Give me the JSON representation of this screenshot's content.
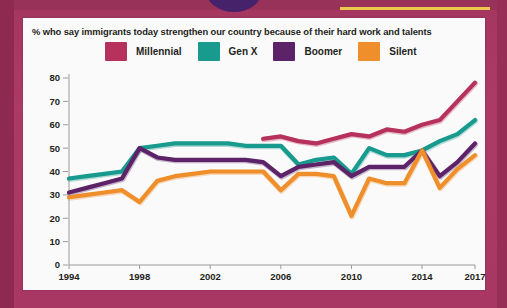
{
  "chart_title": "% who say immigrants today strengthen our country because of their hard work and talents",
  "legend": {
    "items": [
      {
        "label": "Millennial",
        "color": "#b6325c",
        "swatch_name": "legend-swatch-millennial"
      },
      {
        "label": "Gen X",
        "color": "#189a8e",
        "swatch_name": "legend-swatch-genx"
      },
      {
        "label": "Boomer",
        "color": "#5d2368",
        "swatch_name": "legend-swatch-boomer"
      },
      {
        "label": "Silent",
        "color": "#ef8f2c",
        "swatch_name": "legend-swatch-silent"
      }
    ]
  },
  "axes": {
    "y_ticks": [
      "0",
      "10",
      "20",
      "30",
      "40",
      "50",
      "60",
      "70",
      "80"
    ],
    "x_ticks": [
      "1994",
      "1998",
      "2002",
      "2006",
      "2010",
      "2014",
      "2017"
    ]
  },
  "decor": {
    "frame_color": "#a93b66",
    "circle_color": "#46226b",
    "accent_yellow": "#e9c84a"
  },
  "chart_data": {
    "type": "line",
    "title": "% who say immigrants today strengthen our country because of their hard work and talents",
    "xlabel": "",
    "ylabel": "",
    "xlim": [
      1994,
      2017
    ],
    "ylim": [
      0,
      80
    ],
    "grid": false,
    "legend_position": "top",
    "x_tick_values": [
      1994,
      1998,
      2002,
      2006,
      2010,
      2014,
      2017
    ],
    "y_tick_values": [
      0,
      10,
      20,
      30,
      40,
      50,
      60,
      70,
      80
    ],
    "series": [
      {
        "name": "Millennial",
        "color": "#b6325c",
        "x": [
          2005,
          2006,
          2007,
          2008,
          2009,
          2010,
          2011,
          2012,
          2013,
          2014,
          2015,
          2016,
          2017
        ],
        "values": [
          54,
          55,
          53,
          52,
          54,
          56,
          55,
          58,
          57,
          60,
          62,
          70,
          78
        ]
      },
      {
        "name": "Gen X",
        "color": "#189a8e",
        "x": [
          1994,
          1995,
          1996,
          1997,
          1998,
          1999,
          2000,
          2001,
          2002,
          2003,
          2004,
          2005,
          2006,
          2007,
          2008,
          2009,
          2010,
          2011,
          2012,
          2013,
          2014,
          2015,
          2016,
          2017
        ],
        "values": [
          37,
          38,
          39,
          40,
          50,
          51,
          52,
          52,
          52,
          52,
          51,
          51,
          51,
          43,
          45,
          46,
          39,
          50,
          47,
          47,
          49,
          53,
          56,
          62
        ]
      },
      {
        "name": "Boomer",
        "color": "#5d2368",
        "x": [
          1994,
          1995,
          1996,
          1997,
          1998,
          1999,
          2000,
          2001,
          2002,
          2003,
          2004,
          2005,
          2006,
          2007,
          2008,
          2009,
          2010,
          2011,
          2012,
          2013,
          2014,
          2015,
          2016,
          2017
        ],
        "values": [
          31,
          33,
          35,
          37,
          50,
          46,
          45,
          45,
          45,
          45,
          45,
          44,
          38,
          42,
          43,
          44,
          38,
          42,
          42,
          42,
          49,
          38,
          44,
          52
        ]
      },
      {
        "name": "Silent",
        "color": "#ef8f2c",
        "x": [
          1994,
          1995,
          1996,
          1997,
          1998,
          1999,
          2000,
          2001,
          2002,
          2003,
          2004,
          2005,
          2006,
          2007,
          2008,
          2009,
          2010,
          2011,
          2012,
          2013,
          2014,
          2015,
          2016,
          2017
        ],
        "values": [
          29,
          30,
          31,
          32,
          27,
          36,
          38,
          39,
          40,
          40,
          40,
          40,
          32,
          39,
          39,
          38,
          21,
          37,
          35,
          35,
          49,
          33,
          41,
          47
        ]
      }
    ]
  }
}
